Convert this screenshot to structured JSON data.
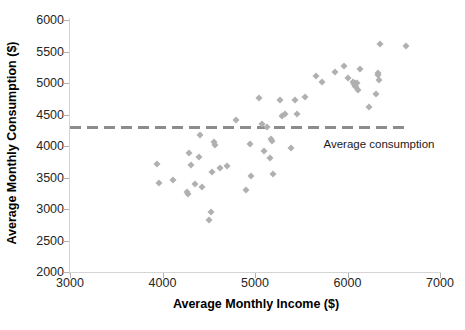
{
  "chart_data": {
    "type": "scatter",
    "title": "",
    "xlabel": "Average Monthly Income   ($)",
    "ylabel": "Average Monthly Consumption ($)",
    "xlim": [
      3000,
      7000
    ],
    "ylim": [
      2000,
      6000
    ],
    "xticks": [
      3000,
      4000,
      5000,
      6000,
      7000
    ],
    "yticks": [
      2000,
      2500,
      3000,
      3500,
      4000,
      4500,
      5000,
      5500,
      6000
    ],
    "xtick_labels": [
      "3000",
      "4000",
      "5000",
      "6000",
      "7000"
    ],
    "ytick_labels": [
      "2000",
      "2500",
      "3000",
      "3500",
      "4000",
      "4500",
      "5000",
      "5500",
      "6000"
    ],
    "grid": false,
    "legend": "none",
    "marker": "diamond",
    "marker_color": "#b0b0b0",
    "reference_line": {
      "label": "Average consumption",
      "orientation": "horizontal",
      "y": 4300,
      "style": "dashed",
      "color": "#8c8c8c",
      "x_start": 3000,
      "x_end": 6630
    },
    "series": [
      {
        "name": "Households",
        "points": [
          [
            3940,
            3720
          ],
          [
            3960,
            3415
          ],
          [
            4110,
            3455
          ],
          [
            4265,
            3270
          ],
          [
            4275,
            3245
          ],
          [
            4290,
            3885
          ],
          [
            4310,
            3700
          ],
          [
            4355,
            3400
          ],
          [
            4390,
            3830
          ],
          [
            4400,
            4170
          ],
          [
            4425,
            3350
          ],
          [
            4500,
            2825
          ],
          [
            4520,
            2945
          ],
          [
            4530,
            3595
          ],
          [
            4560,
            4065
          ],
          [
            4570,
            4010
          ],
          [
            4625,
            3650
          ],
          [
            4700,
            3685
          ],
          [
            4790,
            4420
          ],
          [
            4905,
            3305
          ],
          [
            4950,
            4030
          ],
          [
            4960,
            3530
          ],
          [
            5045,
            4755
          ],
          [
            5080,
            4350
          ],
          [
            5095,
            3915
          ],
          [
            5130,
            4295
          ],
          [
            5160,
            3815
          ],
          [
            5175,
            4110
          ],
          [
            5185,
            4085
          ],
          [
            5195,
            3555
          ],
          [
            5270,
            4725
          ],
          [
            5290,
            4475
          ],
          [
            5325,
            4510
          ],
          [
            5385,
            3965
          ],
          [
            5430,
            4725
          ],
          [
            5455,
            4510
          ],
          [
            5545,
            4780
          ],
          [
            5660,
            5115
          ],
          [
            5725,
            5010
          ],
          [
            5860,
            5175
          ],
          [
            5960,
            5265
          ],
          [
            6000,
            5075
          ],
          [
            6055,
            5010
          ],
          [
            6070,
            4980
          ],
          [
            6080,
            4995
          ],
          [
            6085,
            4955
          ],
          [
            6095,
            4930
          ],
          [
            6105,
            5000
          ],
          [
            6115,
            4885
          ],
          [
            6130,
            5215
          ],
          [
            6230,
            4625
          ],
          [
            6310,
            4830
          ],
          [
            6325,
            5165
          ],
          [
            6335,
            5130
          ],
          [
            6345,
            5050
          ],
          [
            6355,
            5615
          ],
          [
            6630,
            5590
          ]
        ]
      }
    ]
  }
}
